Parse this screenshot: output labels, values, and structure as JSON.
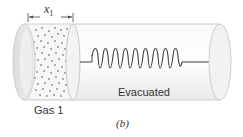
{
  "figure": {
    "dimension_label": "x",
    "dimension_subscript": "1",
    "gas_label": "Gas 1",
    "region_label": "Evacuated",
    "caption": "(b)"
  },
  "colors": {
    "tube_fill": "#f4f4f4",
    "tube_edge": "#c8c8c8",
    "end_cap": "#e6e6e6",
    "spring": "#3a3a3a",
    "gas_dots": "#8a8a8a",
    "text": "#333333"
  }
}
